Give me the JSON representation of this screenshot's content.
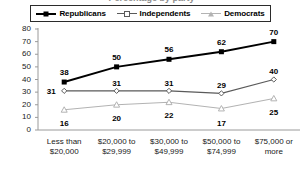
{
  "title": "Percentage by party",
  "legend": {
    "position": "top",
    "items": [
      {
        "label": "Republicans",
        "marker": "filled-square-marker",
        "color": "#000000"
      },
      {
        "label": "Independents",
        "marker": "diamond-marker",
        "color": "#5a5a5a"
      },
      {
        "label": "Democrats",
        "marker": "triangle-marker",
        "color": "#b3b3b3"
      }
    ]
  },
  "chart_data": {
    "type": "line",
    "title": "Percentage by party",
    "xlabel": "",
    "ylabel": "",
    "ylim": [
      0,
      80
    ],
    "yticks": [
      0,
      10,
      20,
      30,
      40,
      50,
      60,
      70,
      80
    ],
    "grid": false,
    "legend_position": "top",
    "categories": [
      "Less than $20,000",
      "$20,000 to $29,999",
      "$30,000 to $49,999",
      "$50,000 to $74,999",
      "$75,000 or more"
    ],
    "category_lines": [
      [
        "Less than",
        "$20,000"
      ],
      [
        "$20,000 to",
        "$29,999"
      ],
      [
        "$30,000 to",
        "$49,999"
      ],
      [
        "$50,000 to",
        "$74,999"
      ],
      [
        "$75,000 or",
        "more"
      ]
    ],
    "series": [
      {
        "name": "Republicans",
        "color": "#000000",
        "marker": "square",
        "values": [
          38,
          50,
          56,
          62,
          70
        ]
      },
      {
        "name": "Independents",
        "color": "#5a5a5a",
        "marker": "diamond",
        "values": [
          31,
          31,
          31,
          29,
          40
        ]
      },
      {
        "name": "Democrats",
        "color": "#b3b3b3",
        "marker": "triangle",
        "values": [
          16,
          20,
          22,
          17,
          25
        ]
      }
    ]
  }
}
